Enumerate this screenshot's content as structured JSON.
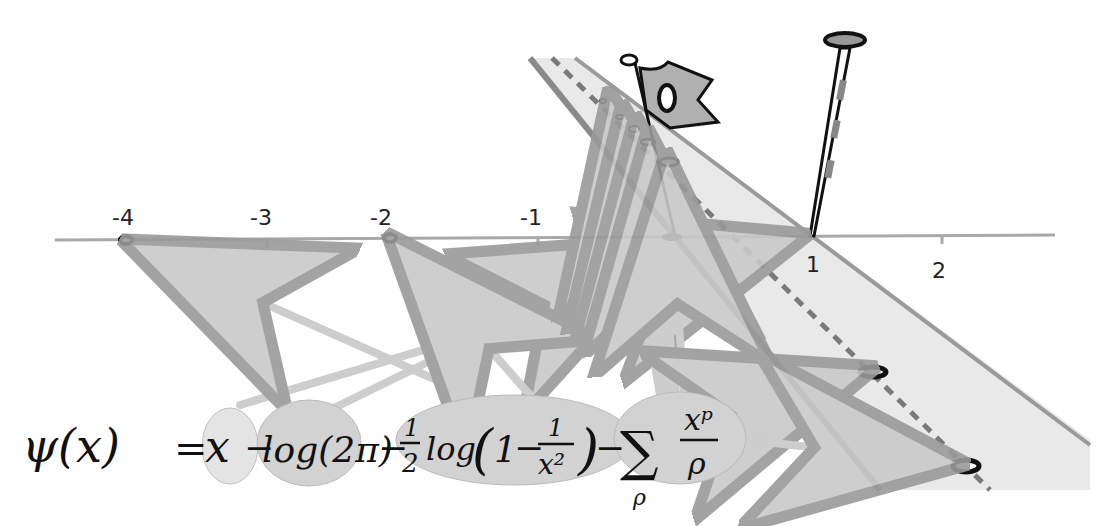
{
  "diagram": {
    "axis": {
      "tick_labels": [
        "-4",
        "-3",
        "-2",
        "-1",
        "1",
        "2"
      ]
    },
    "formula": {
      "lhs": "ψ(x)",
      "equals": "=",
      "term1": "x",
      "minus": "−",
      "term2": "log(2π)",
      "term3_coef_num": "1",
      "term3_coef_den": "2",
      "term3_log": "log",
      "term3_paren_open": "(",
      "term3_one": "1",
      "term3_frac_num": "1",
      "term3_frac_den": "x²",
      "term3_paren_close": ")",
      "term4_sum": "∑",
      "term4_sub": "ρ",
      "term4_num": "xᵖ",
      "term4_den": "ρ"
    },
    "colors": {
      "axis": "#a8a8a8",
      "strip": "#e6e6e6",
      "strip_edge": "#8c8c8c",
      "bubble": "#cfcfcf",
      "bubble_light": "#e4e4e4",
      "arrow": "#c4c4c4",
      "ink": "#111111"
    }
  }
}
